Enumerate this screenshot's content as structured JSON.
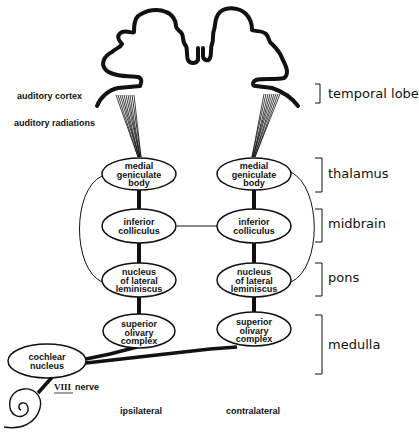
{
  "diagram": {
    "type": "auditory-pathway",
    "left_labels": {
      "auditory_cortex": "auditory cortex",
      "auditory_radiations": "auditory radiations",
      "viii_numeral": "VIII",
      "viii_nerve": "nerve"
    },
    "side_labels": {
      "ipsilateral": "ipsilateral",
      "contralateral": "contralateral"
    },
    "regions": {
      "temporal_lobe": "temporal lobe",
      "thalamus": "thalamus",
      "midbrain": "midbrain",
      "pons": "pons",
      "medulla": "medulla"
    },
    "nodes": {
      "left": {
        "mgb": [
          "medial",
          "geniculate",
          "body"
        ],
        "ic": [
          "inferior",
          "colliculus"
        ],
        "nll": [
          "nucleus",
          "of lateral",
          "leminiscus"
        ],
        "soc": [
          "superior",
          "olivary",
          "complex"
        ]
      },
      "right": {
        "mgb": [
          "medial",
          "geniculate",
          "body"
        ],
        "ic": [
          "inferior",
          "colliculus"
        ],
        "nll": [
          "nucleus",
          "of lateral",
          "leminiscus"
        ],
        "soc": [
          "superior",
          "olivary",
          "complex"
        ]
      },
      "cochlear": [
        "cochlear",
        "nucleus"
      ]
    },
    "colors": {
      "ink": "#111111",
      "background": "#ffffff"
    }
  }
}
